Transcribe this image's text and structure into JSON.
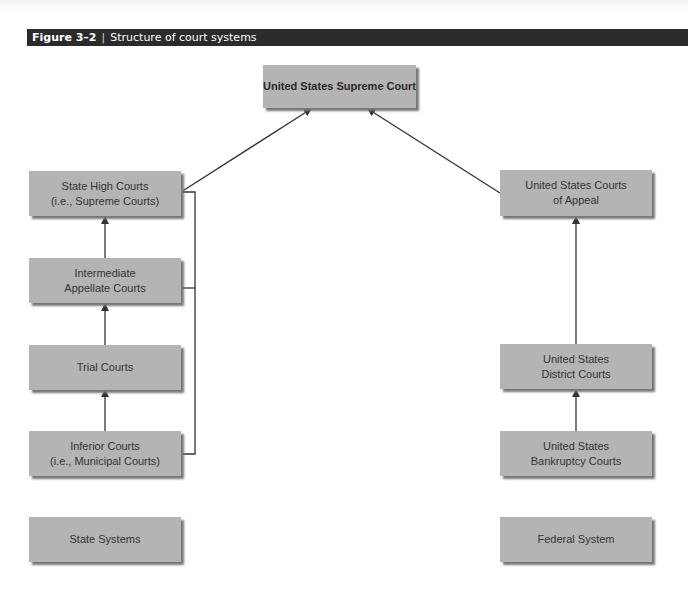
{
  "figure": {
    "number": "Figure 3–2",
    "separator": "|",
    "title": "Structure of court systems"
  },
  "nodes": {
    "supreme": "United States Supreme Court",
    "state_high_1": "State High Courts",
    "state_high_2": "(i.e., Supreme Courts)",
    "intermediate_1": "Intermediate",
    "intermediate_2": "Appellate Courts",
    "trial": "Trial Courts",
    "inferior_1": "Inferior Courts",
    "inferior_2": "(i.e., Municipal Courts)",
    "us_appeal_1": "United States Courts",
    "us_appeal_2": "of Appeal",
    "us_district_1": "United States",
    "us_district_2": "District Courts",
    "us_bankruptcy_1": "United States",
    "us_bankruptcy_2": "Bankruptcy Courts"
  },
  "legend": {
    "state": "State Systems",
    "federal": "Federal System"
  },
  "colors": {
    "box_fill": "#b4b4b4",
    "header_bg": "#2b2b2b",
    "line": "#333333"
  }
}
